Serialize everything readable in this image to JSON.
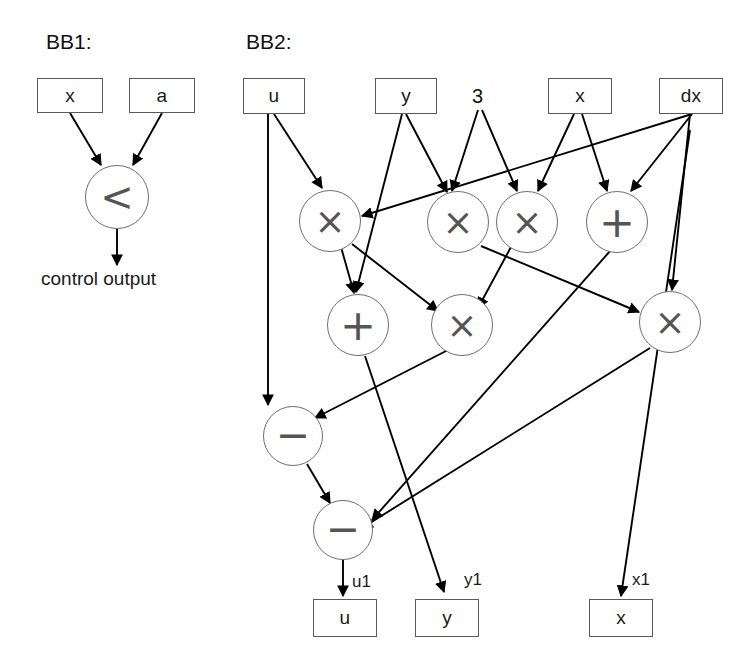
{
  "diagram": {
    "type": "dataflow-graph",
    "width": 755,
    "height": 668,
    "background": "#ffffff",
    "line_color": "#000000",
    "box_border_color": "#5a5a5a",
    "circle_border_color": "#6e6e6e",
    "glyph_color": "#555555"
  },
  "blocks": [
    {
      "id": "bb1",
      "title": "BB1:"
    },
    {
      "id": "bb2",
      "title": "BB2:"
    }
  ],
  "bb1": {
    "title": "BB1:",
    "inputs": [
      {
        "id": "bb1_x",
        "label": "x"
      },
      {
        "id": "bb1_a",
        "label": "a"
      }
    ],
    "operators": [
      {
        "id": "bb1_lt",
        "label": "<",
        "kind": "less-than"
      }
    ],
    "outputs": [
      {
        "id": "bb1_out",
        "label": "control output"
      }
    ]
  },
  "bb2": {
    "title": "BB2:",
    "inputs": [
      {
        "id": "in_u",
        "label": "u"
      },
      {
        "id": "in_y",
        "label": "y"
      },
      {
        "id": "in_x",
        "label": "x"
      },
      {
        "id": "in_dx",
        "label": "dx"
      }
    ],
    "literals": [
      {
        "id": "lit_3",
        "label": "3"
      }
    ],
    "operators": [
      {
        "id": "mul1",
        "label": "×",
        "kind": "multiply"
      },
      {
        "id": "mul2",
        "label": "×",
        "kind": "multiply"
      },
      {
        "id": "mul3",
        "label": "×",
        "kind": "multiply"
      },
      {
        "id": "add1",
        "label": "+",
        "kind": "add"
      },
      {
        "id": "add2",
        "label": "+",
        "kind": "add"
      },
      {
        "id": "mul4",
        "label": "×",
        "kind": "multiply"
      },
      {
        "id": "mul5",
        "label": "×",
        "kind": "multiply"
      },
      {
        "id": "sub1",
        "label": "−",
        "kind": "subtract"
      },
      {
        "id": "sub2",
        "label": "−",
        "kind": "subtract"
      }
    ],
    "edge_labels": [
      {
        "id": "lbl_u1",
        "label": "u1"
      },
      {
        "id": "lbl_y1",
        "label": "y1"
      },
      {
        "id": "lbl_x1",
        "label": "x1"
      }
    ],
    "outputs": [
      {
        "id": "out_u",
        "label": "u"
      },
      {
        "id": "out_y",
        "label": "y"
      },
      {
        "id": "out_x",
        "label": "x"
      }
    ]
  }
}
